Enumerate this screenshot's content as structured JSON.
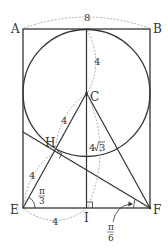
{
  "diagram": {
    "points": {
      "A": "A",
      "B": "B",
      "C": "C",
      "E": "E",
      "F": "F",
      "H": "H",
      "I": "I"
    },
    "measurements": {
      "AB": "8",
      "C_top": "4",
      "CH": "4",
      "EH": "4",
      "EI": "4",
      "CI": "4√3",
      "CI_prefix": "4",
      "CI_radicand": "3"
    },
    "angles": {
      "angle_E": {
        "numerator": "π",
        "denominator": "3"
      },
      "angle_F": {
        "numerator": "π",
        "denominator": "6"
      }
    },
    "colors": {
      "line": "#333333",
      "dashed": "#999999",
      "text": "#333333"
    }
  }
}
